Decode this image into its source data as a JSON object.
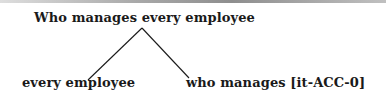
{
  "tree": {
    "root": {
      "label": "Who manages every employee"
    },
    "children": [
      {
        "label": "every employee"
      },
      {
        "label": "who manages [it-ACC-0]"
      }
    ],
    "edges": [
      {
        "from": "root",
        "to": "children.0",
        "x1": 142,
        "y1": 28,
        "x2": 88,
        "y2": 80
      },
      {
        "from": "root",
        "to": "children.1",
        "x1": 142,
        "y1": 28,
        "x2": 189,
        "y2": 78
      }
    ],
    "edge_color": "#1a1a1a",
    "text_color": "#1a1a1a"
  }
}
